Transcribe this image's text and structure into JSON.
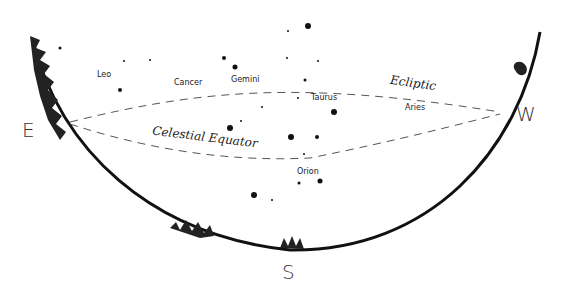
{
  "directions": {
    "east": "E",
    "west": "W",
    "south": "S"
  },
  "lines": {
    "ecliptic": "Ecliptic",
    "celestial_equator": "Celestial Equator"
  },
  "constellations": [
    "Leo",
    "Cancer",
    "Gemini",
    "Taurus",
    "Aries",
    "Orion"
  ],
  "colors": {
    "ink": "#111111",
    "background": "#ffffff"
  }
}
